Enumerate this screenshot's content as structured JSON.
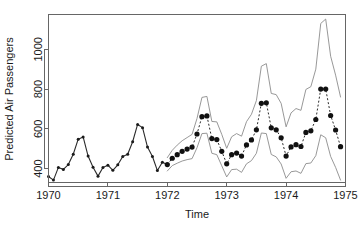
{
  "chart_data": {
    "type": "line",
    "title": "",
    "xlabel": "Time",
    "ylabel": "Predicted Air Passengers",
    "xlim": [
      1970.0,
      1975.0
    ],
    "ylim": [
      330,
      1175
    ],
    "grid": false,
    "legend": "none",
    "xticks": [
      1970,
      1971,
      1972,
      1973,
      1974,
      1975
    ],
    "xtick_labels": [
      "1970",
      "1971",
      "1972",
      "1973",
      "1974",
      "1975"
    ],
    "yticks": [
      400,
      600,
      800,
      1000
    ],
    "ytick_labels": [
      "400",
      "600",
      "800",
      "1000"
    ],
    "colors": {
      "observed": "#2b2b2b",
      "forecast": "#111111",
      "interval": "#8c8c8c",
      "axis": "#666666",
      "background": "#ffffff"
    },
    "series": [
      {
        "name": "observed",
        "style": "solid-line-with-points",
        "x": [
          1970.0,
          1970.0833,
          1970.1667,
          1970.25,
          1970.3333,
          1970.4167,
          1970.5,
          1970.5833,
          1970.6667,
          1970.75,
          1970.8333,
          1970.9167,
          1971.0,
          1971.0833,
          1971.1667,
          1971.25,
          1971.3333,
          1971.4167,
          1971.5,
          1971.5833,
          1971.6667,
          1971.75,
          1971.8333,
          1971.9167,
          1972.0
        ],
        "values": [
          360,
          342,
          406,
          396,
          420,
          472,
          548,
          559,
          463,
          407,
          362,
          405,
          417,
          391,
          419,
          461,
          472,
          535,
          622,
          606,
          508,
          461,
          390,
          432,
          420
        ]
      },
      {
        "name": "forecast",
        "style": "dotted-line-with-points",
        "x": [
          1972.0,
          1972.0833,
          1972.1667,
          1972.25,
          1972.3333,
          1972.4167,
          1972.5,
          1972.5833,
          1972.6667,
          1972.75,
          1972.8333,
          1972.9167,
          1973.0,
          1973.0833,
          1973.1667,
          1973.25,
          1973.3333,
          1973.4167,
          1973.5,
          1973.5833,
          1973.6667,
          1973.75,
          1973.8333,
          1973.9167,
          1974.0,
          1974.0833,
          1974.1667,
          1974.25,
          1974.3333,
          1974.4167,
          1974.5,
          1974.5833,
          1974.6667,
          1974.75,
          1974.8333,
          1974.9167
        ],
        "values": [
          420,
          452,
          470,
          487,
          498,
          508,
          574,
          661,
          665,
          551,
          546,
          487,
          424,
          470,
          478,
          463,
          519,
          544,
          595,
          728,
          731,
          605,
          595,
          555,
          463,
          509,
          520,
          511,
          582,
          590,
          647,
          800,
          800,
          667,
          594,
          510
        ]
      },
      {
        "name": "upper-prediction-interval",
        "style": "thin-line",
        "x": [
          1972.0,
          1972.0833,
          1972.1667,
          1972.25,
          1972.3333,
          1972.4167,
          1972.5,
          1972.5833,
          1972.6667,
          1972.75,
          1972.8333,
          1972.9167,
          1973.0,
          1973.0833,
          1973.1667,
          1973.25,
          1973.3333,
          1973.4167,
          1973.5,
          1973.5833,
          1973.6667,
          1973.75,
          1973.8333,
          1973.9167,
          1974.0,
          1974.0833,
          1974.1667,
          1974.25,
          1974.3333,
          1974.4167,
          1974.5,
          1974.5833,
          1974.6667,
          1974.75,
          1974.8333,
          1974.9167
        ],
        "values": [
          455,
          492,
          518,
          540,
          556,
          572,
          652,
          758,
          763,
          637,
          635,
          572,
          502,
          560,
          576,
          563,
          636,
          673,
          742,
          915,
          928,
          778,
          772,
          728,
          610,
          680,
          702,
          693,
          798,
          812,
          900,
          1130,
          1152,
          965,
          870,
          760
        ],
        "annotation": "upper band, peaks near 1150"
      },
      {
        "name": "lower-prediction-interval",
        "style": "thin-line",
        "x": [
          1972.0,
          1972.0833,
          1972.1667,
          1972.25,
          1972.3333,
          1972.4167,
          1972.5,
          1972.5833,
          1972.6667,
          1972.75,
          1972.8333,
          1972.9167,
          1973.0,
          1973.0833,
          1973.1667,
          1973.25,
          1973.3333,
          1973.4167,
          1973.5,
          1973.5833,
          1973.6667,
          1973.75,
          1973.8333,
          1973.9167,
          1974.0,
          1974.0833,
          1974.1667,
          1974.25,
          1974.3333,
          1974.4167,
          1974.5,
          1974.5833,
          1974.6667,
          1974.75,
          1974.8333,
          1974.9167
        ],
        "values": [
          388,
          415,
          427,
          438,
          445,
          450,
          505,
          576,
          578,
          477,
          470,
          414,
          358,
          395,
          397,
          381,
          424,
          440,
          477,
          579,
          576,
          471,
          459,
          423,
          351,
          384,
          388,
          376,
          425,
          428,
          465,
          570,
          555,
          461,
          406,
          342
        ],
        "annotation": "lower band, dips near 340"
      }
    ]
  }
}
